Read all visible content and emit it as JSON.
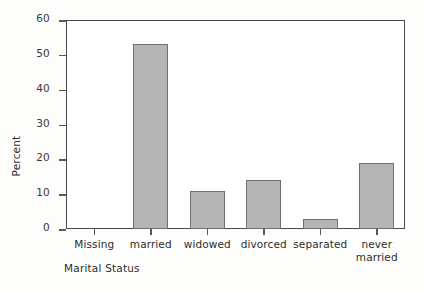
{
  "chart_data": {
    "type": "bar",
    "title": "",
    "categories": [
      "Missing",
      "married",
      "widowed",
      "divorced",
      "separated",
      "never married"
    ],
    "category_lines": [
      [
        "Missing"
      ],
      [
        "married"
      ],
      [
        "widowed"
      ],
      [
        "divorced"
      ],
      [
        "separated"
      ],
      [
        "never",
        "married"
      ]
    ],
    "values": [
      0,
      53,
      11,
      14,
      3,
      19
    ],
    "xlabel": "Marital Status",
    "ylabel": "Percent",
    "ylim": [
      0,
      60
    ],
    "yticks": [
      0,
      10,
      20,
      30,
      40,
      50,
      60
    ],
    "ytick_labels": [
      "0",
      "10",
      "20",
      "30",
      "40",
      "50",
      "60"
    ],
    "grid": false,
    "legend": null,
    "bar_color": "#b5b5b5",
    "bar_border_color": "#6f6f6f",
    "axis_color": "#4a4a4a",
    "background": "#fdfdfb"
  }
}
